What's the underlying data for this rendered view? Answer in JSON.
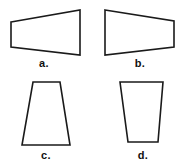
{
  "figure": {
    "type": "geometry-shapes",
    "background_color": "#ffffff",
    "stroke_color": "#1a1a1a",
    "fill_color": "#ffffff",
    "label_color": "#101010",
    "shapes": [
      {
        "id": "shape-a",
        "label": "a.",
        "label_x": 44,
        "label_y": 58,
        "orientation": "horizontal",
        "points": "11,22 80,10 80,55 11,47",
        "notes": "Horizontal trapezoid, short left edge, tall right edge"
      },
      {
        "id": "shape-b",
        "label": "b.",
        "label_x": 140,
        "label_y": 58,
        "orientation": "horizontal",
        "points": "105,10 174,21 174,47 105,55",
        "notes": "Horizontal trapezoid, tall left edge, short right edge (mirror of a)"
      },
      {
        "id": "shape-c",
        "label": "c.",
        "label_x": 46,
        "label_y": 150,
        "orientation": "vertical",
        "points": "33,82 60,82 70,145 22,145",
        "notes": "Vertical trapezoid, narrow top, wide bottom"
      },
      {
        "id": "shape-d",
        "label": "d.",
        "label_x": 143,
        "label_y": 150,
        "orientation": "vertical",
        "points": "120,82 163,82 158,142 128,142",
        "notes": "Vertical trapezoid, wide top, narrow bottom (inverted)"
      }
    ]
  }
}
